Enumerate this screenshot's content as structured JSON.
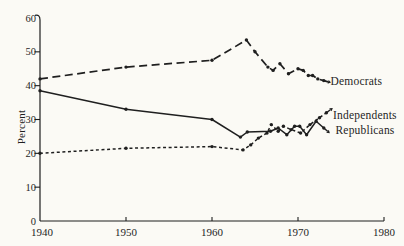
{
  "figure": {
    "background": "#fbfaf5",
    "ink_color": "#1f1f1f"
  },
  "chart_data": {
    "type": "line",
    "title": "",
    "xlabel": "",
    "ylabel": "Percent",
    "xlim": [
      1940,
      1980
    ],
    "ylim": [
      0,
      60
    ],
    "x_tick_values": [
      1940,
      1950,
      1960,
      1970,
      1980
    ],
    "x_tick_labels": [
      "1940",
      "1950",
      "1960",
      "1970",
      "1980"
    ],
    "y_tick_values": [
      0,
      10,
      20,
      30,
      40,
      50,
      60
    ],
    "y_tick_labels": [
      "0",
      "10",
      "20",
      "30",
      "40",
      "50",
      "60"
    ],
    "grid": false,
    "legend_position": "end-of-line labels with leader arrows",
    "series": [
      {
        "name": "Democrats",
        "style": "long-dash",
        "points": [
          [
            1940,
            42
          ],
          [
            1950,
            45.5
          ],
          [
            1960,
            47.5
          ],
          [
            1964,
            53.5
          ],
          [
            1965,
            50
          ],
          [
            1966.5,
            45.5
          ],
          [
            1967.1,
            44.5
          ],
          [
            1967.9,
            46.5
          ],
          [
            1968.9,
            43.5
          ],
          [
            1970,
            45
          ],
          [
            1970.6,
            44.5
          ],
          [
            1971.2,
            43
          ],
          [
            1971.7,
            43
          ],
          [
            1972.3,
            42
          ],
          [
            1973,
            41.5
          ]
        ]
      },
      {
        "name": "Independents",
        "style": "short-dash",
        "points": [
          [
            1940,
            20
          ],
          [
            1950,
            21.5
          ],
          [
            1960,
            22
          ],
          [
            1963.6,
            21
          ],
          [
            1964.5,
            22.5
          ],
          [
            1965.4,
            24.5
          ],
          [
            1966.4,
            26
          ],
          [
            1966.9,
            28.5
          ],
          [
            1967.7,
            26.5
          ],
          [
            1968.3,
            28
          ],
          [
            1969.2,
            27
          ],
          [
            1970.3,
            26
          ],
          [
            1971.4,
            28.5
          ],
          [
            1972.5,
            30.5
          ],
          [
            1973.3,
            32
          ]
        ]
      },
      {
        "name": "Republicans",
        "style": "solid",
        "points": [
          [
            1940,
            38.5
          ],
          [
            1950,
            33
          ],
          [
            1960,
            30
          ],
          [
            1963.3,
            24.8
          ],
          [
            1964.1,
            26.3
          ],
          [
            1966.8,
            26.5
          ],
          [
            1967.7,
            27.5
          ],
          [
            1968.7,
            25.5
          ],
          [
            1969.6,
            28
          ],
          [
            1970.2,
            28
          ],
          [
            1971,
            25.5
          ],
          [
            1972.1,
            29.5
          ],
          [
            1973,
            27.5
          ]
        ]
      }
    ]
  }
}
